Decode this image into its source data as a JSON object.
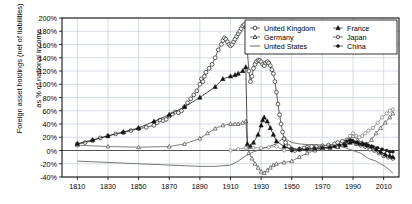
{
  "chart_data": {
    "type": "line",
    "title": "",
    "xlabel": "",
    "ylabel_line1": "Foreign asset holdings (net of liabilities)",
    "ylabel_line2": "as % of national income",
    "xlim": [
      1800,
      2020
    ],
    "ylim": [
      -40,
      200
    ],
    "xticks": [
      1810,
      1830,
      1850,
      1870,
      1890,
      1910,
      1930,
      1950,
      1970,
      1990,
      2010
    ],
    "yticks": [
      -40,
      -20,
      0,
      20,
      40,
      60,
      80,
      100,
      120,
      140,
      160,
      180,
      200
    ],
    "ytick_labels": [
      "-40%",
      "-20%",
      "0%",
      "20%",
      "40%",
      "60%",
      "80%",
      "100%",
      "120%",
      "140%",
      "160%",
      "180%",
      "200%"
    ],
    "xtick_labels": [
      "1810",
      "1830",
      "1850",
      "1870",
      "1890",
      "1910",
      "1930",
      "1950",
      "1970",
      "1990",
      "2010"
    ],
    "grid": true,
    "legend_position": "top-right",
    "legend_columns": 2,
    "series": [
      {
        "name": "United Kingdom",
        "marker": "open-circle",
        "color": "#2b2b2b",
        "points": [
          [
            1810,
            10
          ],
          [
            1815,
            12
          ],
          [
            1820,
            15
          ],
          [
            1825,
            19
          ],
          [
            1830,
            22
          ],
          [
            1835,
            25
          ],
          [
            1840,
            27
          ],
          [
            1845,
            30
          ],
          [
            1850,
            33
          ],
          [
            1855,
            35
          ],
          [
            1860,
            38
          ],
          [
            1862,
            42
          ],
          [
            1864,
            46
          ],
          [
            1866,
            45
          ],
          [
            1868,
            47
          ],
          [
            1870,
            52
          ],
          [
            1872,
            55
          ],
          [
            1874,
            58
          ],
          [
            1876,
            57
          ],
          [
            1878,
            60
          ],
          [
            1880,
            66
          ],
          [
            1882,
            72
          ],
          [
            1884,
            78
          ],
          [
            1886,
            84
          ],
          [
            1888,
            90
          ],
          [
            1890,
            100
          ],
          [
            1891,
            108
          ],
          [
            1892,
            104
          ],
          [
            1893,
            112
          ],
          [
            1894,
            118
          ],
          [
            1896,
            124
          ],
          [
            1898,
            130
          ],
          [
            1900,
            140
          ],
          [
            1902,
            152
          ],
          [
            1904,
            160
          ],
          [
            1905,
            166
          ],
          [
            1906,
            170
          ],
          [
            1907,
            168
          ],
          [
            1908,
            164
          ],
          [
            1909,
            160
          ],
          [
            1910,
            158
          ],
          [
            1911,
            160
          ],
          [
            1912,
            164
          ],
          [
            1913,
            168
          ],
          [
            1914,
            172
          ],
          [
            1915,
            176
          ],
          [
            1916,
            180
          ],
          [
            1917,
            184
          ],
          [
            1918,
            188
          ],
          [
            1919,
            190
          ],
          [
            1920,
            186
          ],
          [
            1921,
            150
          ],
          [
            1922,
            120
          ],
          [
            1923,
            104
          ],
          [
            1924,
            112
          ],
          [
            1925,
            124
          ],
          [
            1926,
            130
          ],
          [
            1927,
            134
          ],
          [
            1928,
            136
          ],
          [
            1929,
            136
          ],
          [
            1930,
            134
          ],
          [
            1931,
            130
          ],
          [
            1932,
            128
          ],
          [
            1933,
            132
          ],
          [
            1934,
            134
          ],
          [
            1935,
            132
          ],
          [
            1936,
            128
          ],
          [
            1937,
            122
          ],
          [
            1938,
            116
          ],
          [
            1939,
            104
          ],
          [
            1940,
            88
          ],
          [
            1941,
            70
          ],
          [
            1942,
            54
          ],
          [
            1943,
            40
          ],
          [
            1944,
            28
          ],
          [
            1945,
            18
          ],
          [
            1946,
            12
          ],
          [
            1948,
            6
          ],
          [
            1950,
            2
          ],
          [
            1952,
            0
          ],
          [
            1955,
            2
          ],
          [
            1958,
            4
          ],
          [
            1960,
            5
          ],
          [
            1963,
            6
          ],
          [
            1966,
            6
          ],
          [
            1970,
            7
          ],
          [
            1974,
            8
          ],
          [
            1978,
            10
          ],
          [
            1980,
            12
          ],
          [
            1983,
            14
          ],
          [
            1986,
            16
          ],
          [
            1989,
            14
          ],
          [
            1992,
            10
          ],
          [
            1995,
            8
          ],
          [
            1998,
            6
          ],
          [
            2001,
            2
          ],
          [
            2004,
            0
          ],
          [
            2007,
            -4
          ],
          [
            2010,
            -8
          ],
          [
            2013,
            -10
          ],
          [
            2016,
            -12
          ]
        ]
      },
      {
        "name": "Germany",
        "marker": "open-triangle",
        "color": "#555555",
        "points": [
          [
            1810,
            8
          ],
          [
            1830,
            6
          ],
          [
            1850,
            5
          ],
          [
            1870,
            6
          ],
          [
            1880,
            10
          ],
          [
            1890,
            18
          ],
          [
            1895,
            26
          ],
          [
            1900,
            33
          ],
          [
            1905,
            38
          ],
          [
            1910,
            40
          ],
          [
            1913,
            40
          ],
          [
            1915,
            40
          ],
          [
            1918,
            42
          ],
          [
            1920,
            44
          ],
          [
            1921,
            8
          ],
          [
            1922,
            -4
          ],
          [
            1924,
            -12
          ],
          [
            1926,
            -20
          ],
          [
            1928,
            -26
          ],
          [
            1930,
            -32
          ],
          [
            1932,
            -34
          ],
          [
            1934,
            -30
          ],
          [
            1936,
            -26
          ],
          [
            1938,
            -22
          ],
          [
            1940,
            -20
          ],
          [
            1945,
            -18
          ],
          [
            1950,
            -16
          ],
          [
            1955,
            -10
          ],
          [
            1960,
            -4
          ],
          [
            1965,
            0
          ],
          [
            1970,
            2
          ],
          [
            1975,
            4
          ],
          [
            1980,
            6
          ],
          [
            1985,
            12
          ],
          [
            1988,
            18
          ],
          [
            1990,
            22
          ],
          [
            1993,
            16
          ],
          [
            1996,
            12
          ],
          [
            1999,
            10
          ],
          [
            2002,
            16
          ],
          [
            2005,
            26
          ],
          [
            2008,
            34
          ],
          [
            2011,
            42
          ],
          [
            2014,
            50
          ],
          [
            2016,
            56
          ]
        ]
      },
      {
        "name": "United States",
        "marker": "none",
        "color": "#6b6b6b",
        "points": [
          [
            1810,
            -16
          ],
          [
            1830,
            -18
          ],
          [
            1850,
            -20
          ],
          [
            1870,
            -22
          ],
          [
            1890,
            -24
          ],
          [
            1900,
            -24
          ],
          [
            1910,
            -22
          ],
          [
            1915,
            -16
          ],
          [
            1920,
            -8
          ],
          [
            1925,
            -2
          ],
          [
            1930,
            2
          ],
          [
            1935,
            6
          ],
          [
            1940,
            10
          ],
          [
            1942,
            14
          ],
          [
            1944,
            18
          ],
          [
            1945,
            20
          ],
          [
            1947,
            16
          ],
          [
            1950,
            12
          ],
          [
            1955,
            10
          ],
          [
            1960,
            9
          ],
          [
            1965,
            9
          ],
          [
            1970,
            8
          ],
          [
            1975,
            8
          ],
          [
            1980,
            8
          ],
          [
            1985,
            4
          ],
          [
            1990,
            0
          ],
          [
            1995,
            -4
          ],
          [
            2000,
            -12
          ],
          [
            2005,
            -16
          ],
          [
            2008,
            -20
          ],
          [
            2011,
            -24
          ],
          [
            2014,
            -30
          ],
          [
            2016,
            -34
          ]
        ]
      },
      {
        "name": "France",
        "marker": "filled-triangle",
        "color": "#111111",
        "points": [
          [
            1810,
            10
          ],
          [
            1820,
            16
          ],
          [
            1830,
            22
          ],
          [
            1840,
            28
          ],
          [
            1850,
            34
          ],
          [
            1860,
            44
          ],
          [
            1870,
            54
          ],
          [
            1880,
            66
          ],
          [
            1890,
            80
          ],
          [
            1900,
            96
          ],
          [
            1905,
            108
          ],
          [
            1910,
            112
          ],
          [
            1913,
            114
          ],
          [
            1915,
            116
          ],
          [
            1918,
            120
          ],
          [
            1920,
            126
          ],
          [
            1921,
            10
          ],
          [
            1923,
            6
          ],
          [
            1925,
            12
          ],
          [
            1928,
            24
          ],
          [
            1930,
            38
          ],
          [
            1931,
            46
          ],
          [
            1932,
            50
          ],
          [
            1934,
            44
          ],
          [
            1936,
            34
          ],
          [
            1938,
            24
          ],
          [
            1940,
            14
          ],
          [
            1945,
            6
          ],
          [
            1950,
            2
          ],
          [
            1955,
            2
          ],
          [
            1960,
            2
          ],
          [
            1965,
            3
          ],
          [
            1970,
            4
          ],
          [
            1975,
            5
          ],
          [
            1980,
            6
          ],
          [
            1985,
            8
          ],
          [
            1988,
            12
          ],
          [
            1990,
            14
          ],
          [
            1993,
            12
          ],
          [
            1996,
            10
          ],
          [
            1999,
            8
          ],
          [
            2002,
            6
          ],
          [
            2005,
            2
          ],
          [
            2008,
            -2
          ],
          [
            2011,
            -6
          ],
          [
            2014,
            -8
          ],
          [
            2016,
            -10
          ]
        ]
      },
      {
        "name": "Japan",
        "marker": "open-circle-small",
        "color": "#7a7a7a",
        "points": [
          [
            1910,
            0
          ],
          [
            1915,
            2
          ],
          [
            1920,
            4
          ],
          [
            1925,
            4
          ],
          [
            1930,
            4
          ],
          [
            1935,
            5
          ],
          [
            1940,
            6
          ],
          [
            1945,
            0
          ],
          [
            1950,
            0
          ],
          [
            1955,
            1
          ],
          [
            1960,
            2
          ],
          [
            1965,
            3
          ],
          [
            1970,
            4
          ],
          [
            1975,
            5
          ],
          [
            1980,
            6
          ],
          [
            1983,
            10
          ],
          [
            1986,
            16
          ],
          [
            1988,
            22
          ],
          [
            1990,
            26
          ],
          [
            1992,
            22
          ],
          [
            1994,
            20
          ],
          [
            1996,
            22
          ],
          [
            1998,
            26
          ],
          [
            2000,
            30
          ],
          [
            2003,
            34
          ],
          [
            2006,
            42
          ],
          [
            2009,
            50
          ],
          [
            2012,
            56
          ],
          [
            2014,
            60
          ],
          [
            2016,
            62
          ]
        ]
      },
      {
        "name": "China",
        "marker": "filled-circle-small",
        "color": "#1a1a1a",
        "points": [
          [
            1950,
            0
          ],
          [
            1955,
            1
          ],
          [
            1960,
            2
          ],
          [
            1965,
            3
          ],
          [
            1970,
            4
          ],
          [
            1975,
            5
          ],
          [
            1978,
            6
          ],
          [
            1981,
            8
          ],
          [
            1984,
            10
          ],
          [
            1986,
            14
          ],
          [
            1988,
            16
          ],
          [
            1990,
            14
          ],
          [
            1992,
            12
          ],
          [
            1994,
            10
          ],
          [
            1996,
            10
          ],
          [
            1998,
            10
          ],
          [
            2000,
            8
          ],
          [
            2003,
            6
          ],
          [
            2006,
            4
          ],
          [
            2009,
            2
          ],
          [
            2012,
            0
          ],
          [
            2014,
            -2
          ],
          [
            2016,
            -2
          ]
        ]
      }
    ]
  },
  "legend": {
    "entries": [
      {
        "label": "United Kingdom",
        "marker": "open-circle"
      },
      {
        "label": "France",
        "marker": "filled-triangle"
      },
      {
        "label": "Germany",
        "marker": "open-triangle"
      },
      {
        "label": "Japan",
        "marker": "open-circle-small"
      },
      {
        "label": "United States",
        "marker": "line"
      },
      {
        "label": "China",
        "marker": "filled-circle-small"
      }
    ]
  },
  "colors": {
    "axis": "#000000",
    "grid": "#b9c6d4",
    "background": "#ffffff"
  }
}
